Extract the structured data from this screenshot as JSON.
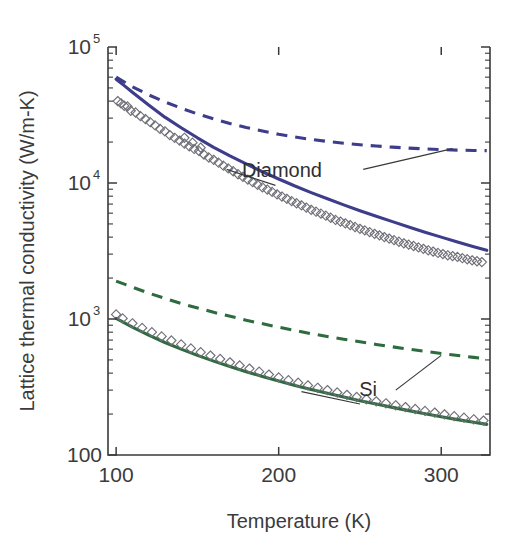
{
  "figure": {
    "title": "",
    "background_color": "#ffffff"
  },
  "chart_data": {
    "type": "line",
    "title": "",
    "subtitle": "",
    "xlabel": "Temperature (K)",
    "ylabel": "Lattice thermal conductivity (W/m-K)",
    "xscale": "linear",
    "yscale": "log",
    "xlim": [
      95,
      330
    ],
    "ylim": [
      100,
      100000
    ],
    "grid": false,
    "legend_position": "inline-annotations",
    "xticks": [
      100,
      200,
      300
    ],
    "xtick_labels": [
      "100",
      "200",
      "300"
    ],
    "yticks": [
      100,
      1000,
      10000,
      100000
    ],
    "ytick_labels": [
      "100",
      "10^3",
      "10^4",
      "10^5"
    ],
    "ytick_label_parts": [
      {
        "base": "100",
        "exp": ""
      },
      {
        "base": "10",
        "exp": "3"
      },
      {
        "base": "10",
        "exp": "4"
      },
      {
        "base": "10",
        "exp": "5"
      }
    ],
    "colors": {
      "diamond": "#3d3d8c",
      "silicon": "#2e6b3e",
      "marker_outline": "#6f6f78",
      "axis": "#3a3a3a",
      "text": "#3b3b3b"
    },
    "series": [
      {
        "name": "Diamond (model, solid)",
        "material": "Diamond",
        "style": "solid",
        "color": "#3d3d8c",
        "x": [
          100,
          105,
          110,
          120,
          130,
          140,
          150,
          160,
          170,
          180,
          190,
          200,
          210,
          220,
          230,
          240,
          250,
          260,
          270,
          280,
          290,
          300,
          310,
          320,
          328
        ],
        "y": [
          58000,
          52000,
          46500,
          37500,
          30500,
          25500,
          21500,
          18300,
          15800,
          13800,
          12100,
          10700,
          9500,
          8500,
          7650,
          6900,
          6250,
          5700,
          5200,
          4750,
          4350,
          4000,
          3680,
          3400,
          3200
        ]
      },
      {
        "name": "Diamond (bulk limit, dashed)",
        "material": "Diamond",
        "style": "dashed",
        "color": "#3d3d8c",
        "x": [
          100,
          110,
          120,
          130,
          140,
          150,
          160,
          170,
          180,
          190,
          200,
          210,
          220,
          230,
          240,
          250,
          260,
          270,
          280,
          290,
          300,
          310,
          320,
          328
        ],
        "y": [
          60000,
          51000,
          44500,
          39500,
          35500,
          32200,
          29600,
          27400,
          25600,
          24100,
          22800,
          21800,
          20900,
          20200,
          19600,
          19100,
          18700,
          18350,
          18050,
          17800,
          17600,
          17450,
          17350,
          17300
        ]
      },
      {
        "name": "Si (model, solid)",
        "material": "Si",
        "style": "solid",
        "color": "#2e6b3e",
        "x": [
          100,
          110,
          120,
          130,
          140,
          150,
          160,
          170,
          180,
          190,
          200,
          210,
          220,
          230,
          240,
          250,
          260,
          270,
          280,
          290,
          300,
          310,
          320,
          328
        ],
        "y": [
          1010,
          870,
          760,
          672,
          600,
          540,
          490,
          447,
          410,
          378,
          350,
          325,
          303,
          284,
          267,
          251,
          237,
          224,
          212,
          201,
          191,
          182,
          174,
          168
        ]
      },
      {
        "name": "Si (bulk limit, dashed)",
        "material": "Si",
        "style": "dashed",
        "color": "#2e6b3e",
        "x": [
          100,
          120,
          140,
          160,
          180,
          200,
          220,
          240,
          260,
          280,
          300,
          320,
          328
        ],
        "y": [
          1900,
          1550,
          1300,
          1120,
          980,
          870,
          780,
          710,
          650,
          600,
          558,
          522,
          510
        ]
      }
    ],
    "scatter": [
      {
        "name": "Diamond experimental data",
        "material": "Diamond",
        "marker": "open-diamond",
        "color": "#6f6f78",
        "points": [
          [
            101,
            40000
          ],
          [
            103,
            38500
          ],
          [
            105,
            37000
          ],
          [
            107,
            36500
          ],
          [
            109,
            34000
          ],
          [
            112,
            33000
          ],
          [
            115,
            31000
          ],
          [
            118,
            29500
          ],
          [
            121,
            28000
          ],
          [
            124,
            26500
          ],
          [
            127,
            25000
          ],
          [
            130,
            24000
          ],
          [
            133,
            22500
          ],
          [
            136,
            21500
          ],
          [
            139,
            20500
          ],
          [
            142,
            19500
          ],
          [
            145,
            18600
          ],
          [
            148,
            17800
          ],
          [
            151,
            17200
          ],
          [
            154,
            16200
          ],
          [
            157,
            15400
          ],
          [
            160,
            14800
          ],
          [
            142,
            21500
          ],
          [
            147,
            19800
          ],
          [
            152,
            18200
          ],
          [
            163,
            14100
          ],
          [
            166,
            13400
          ],
          [
            169,
            12800
          ],
          [
            172,
            12200
          ],
          [
            175,
            11600
          ],
          [
            178,
            11100
          ],
          [
            181,
            10600
          ],
          [
            184,
            10150
          ],
          [
            187,
            9700
          ],
          [
            190,
            9300
          ],
          [
            193,
            8950
          ],
          [
            196,
            8600
          ],
          [
            199,
            8250
          ],
          [
            202,
            7950
          ],
          [
            205,
            7650
          ],
          [
            208,
            7350
          ],
          [
            211,
            7100
          ],
          [
            214,
            6850
          ],
          [
            217,
            6600
          ],
          [
            220,
            6350
          ],
          [
            223,
            6150
          ],
          [
            226,
            5950
          ],
          [
            229,
            5750
          ],
          [
            232,
            5550
          ],
          [
            235,
            5350
          ],
          [
            238,
            5200
          ],
          [
            241,
            5050
          ],
          [
            244,
            4900
          ],
          [
            247,
            4750
          ],
          [
            250,
            4600
          ],
          [
            253,
            4480
          ],
          [
            256,
            4350
          ],
          [
            259,
            4230
          ],
          [
            262,
            4120
          ],
          [
            265,
            4000
          ],
          [
            268,
            3900
          ],
          [
            271,
            3800
          ],
          [
            274,
            3700
          ],
          [
            277,
            3600
          ],
          [
            280,
            3520
          ],
          [
            283,
            3440
          ],
          [
            286,
            3360
          ],
          [
            289,
            3280
          ],
          [
            292,
            3200
          ],
          [
            295,
            3130
          ],
          [
            298,
            3060
          ],
          [
            301,
            3000
          ],
          [
            304,
            2940
          ],
          [
            307,
            2900
          ],
          [
            310,
            2860
          ],
          [
            313,
            2800
          ],
          [
            316,
            2750
          ],
          [
            319,
            2700
          ],
          [
            322,
            2660
          ],
          [
            325,
            2620
          ]
        ]
      },
      {
        "name": "Si experimental data",
        "material": "Si",
        "marker": "open-diamond",
        "color": "#6f6f78",
        "points": [
          [
            100,
            1080
          ],
          [
            104,
            1010
          ],
          [
            110,
            930
          ],
          [
            116,
            860
          ],
          [
            122,
            800
          ],
          [
            128,
            745
          ],
          [
            134,
            695
          ],
          [
            140,
            650
          ],
          [
            146,
            608
          ],
          [
            152,
            570
          ],
          [
            158,
            538
          ],
          [
            164,
            508
          ],
          [
            170,
            480
          ],
          [
            176,
            455
          ],
          [
            182,
            432
          ],
          [
            188,
            410
          ],
          [
            194,
            390
          ],
          [
            200,
            372
          ],
          [
            206,
            355
          ],
          [
            212,
            340
          ],
          [
            218,
            325
          ],
          [
            224,
            312
          ],
          [
            230,
            300
          ],
          [
            236,
            288
          ],
          [
            242,
            277
          ],
          [
            248,
            267
          ],
          [
            254,
            257
          ],
          [
            260,
            248
          ],
          [
            266,
            240
          ],
          [
            272,
            232
          ],
          [
            278,
            225
          ],
          [
            284,
            218
          ],
          [
            290,
            211
          ],
          [
            296,
            205
          ],
          [
            302,
            199
          ],
          [
            308,
            193
          ],
          [
            314,
            188
          ],
          [
            320,
            183
          ],
          [
            326,
            179
          ]
        ]
      }
    ],
    "annotations": [
      {
        "id": "diamond-annotation",
        "label": "Diamond",
        "text_x": 202,
        "text_y": 11000,
        "leaders": [
          {
            "from": [
              198,
              9600
            ],
            "to": [
              168,
              12600
            ]
          },
          {
            "from": [
              252,
              12600
            ],
            "to": [
              307,
              17900
            ]
          }
        ]
      },
      {
        "id": "si-annotation",
        "label": "Si",
        "text_x": 255,
        "text_y": 270,
        "leaders": [
          {
            "from": [
              250,
              237
            ],
            "to": [
              214,
              292
            ]
          },
          {
            "from": [
              272,
              300
            ],
            "to": [
              300,
              540
            ]
          }
        ]
      }
    ]
  }
}
